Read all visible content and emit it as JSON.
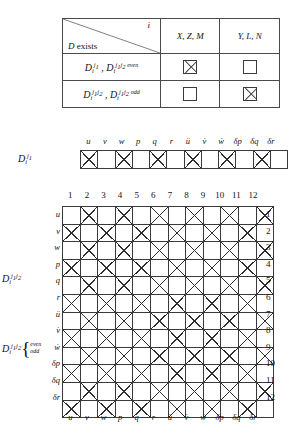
{
  "legend": {
    "corner": {
      "axis_col": "i",
      "axis_row_prefix": "D",
      "axis_row_text": " exists"
    },
    "col_headers": [
      "X, Z, M",
      "Y, L, N"
    ],
    "rows": [
      {
        "label_parts": [
          "D",
          "i",
          "j1",
          "D",
          "i",
          "j1 j2 even"
        ],
        "cells": [
          "x",
          "empty"
        ]
      },
      {
        "label_parts": [
          "D",
          "i",
          "j1 j2",
          "D",
          "i",
          "j1 j2 odd"
        ],
        "cells": [
          "empty",
          "x"
        ]
      }
    ],
    "row_label_display": [
      "Di^j1 , Di^j1j2 even",
      "Di^j1j2 , Di^j1j2 odd"
    ]
  },
  "strip": {
    "label": "Di^j1",
    "headers": [
      "u",
      "v",
      "w",
      "p",
      "q",
      "r",
      "ü",
      "v̇",
      "ẇ",
      "δp",
      "δq",
      "δr"
    ],
    "marks": [
      1,
      0,
      1,
      0,
      1,
      0,
      1,
      0,
      1,
      0,
      1,
      0
    ]
  },
  "main": {
    "col_numbers": [
      "1",
      "2",
      "3",
      "4",
      "5",
      "6",
      "7",
      "8",
      "9",
      "10",
      "11",
      "12"
    ],
    "row_numbers": [
      "1",
      "2",
      "3",
      "4",
      "5",
      "6",
      "7",
      "8",
      "9",
      "10",
      "11",
      "12"
    ],
    "row_headers": [
      "u",
      "v",
      "w",
      "p",
      "q",
      "r",
      "ü",
      "v̇",
      "ẇ",
      "δp",
      "δq",
      "δr"
    ],
    "bottom_headers": [
      "u",
      "v",
      "w",
      "p",
      "q",
      "r",
      "ü",
      "v̇",
      "ẇ",
      "δp",
      "δq",
      "δr"
    ],
    "side_label_top": "Di^j1j2",
    "side_label_bottom": "Di^j1j2",
    "brace_even": "even",
    "brace_odd": "odd",
    "matrix": [
      [
        0,
        1,
        0,
        1,
        0,
        1,
        0,
        1,
        0,
        1,
        0,
        1
      ],
      [
        1,
        0,
        1,
        0,
        1,
        0,
        1,
        0,
        1,
        0,
        1,
        0
      ],
      [
        0,
        1,
        0,
        1,
        0,
        1,
        0,
        1,
        0,
        1,
        0,
        1
      ],
      [
        1,
        0,
        1,
        0,
        1,
        0,
        1,
        0,
        1,
        0,
        1,
        0
      ],
      [
        0,
        1,
        0,
        1,
        0,
        1,
        0,
        1,
        0,
        1,
        0,
        1
      ],
      [
        1,
        0,
        1,
        0,
        1,
        0,
        1,
        0,
        1,
        0,
        1,
        0
      ],
      [
        0,
        1,
        0,
        1,
        0,
        1,
        0,
        1,
        0,
        1,
        0,
        1
      ],
      [
        1,
        0,
        1,
        0,
        1,
        0,
        1,
        0,
        1,
        0,
        1,
        0
      ],
      [
        0,
        1,
        0,
        1,
        0,
        1,
        0,
        1,
        0,
        1,
        0,
        1
      ],
      [
        1,
        0,
        1,
        0,
        1,
        0,
        1,
        0,
        1,
        0,
        1,
        0
      ],
      [
        0,
        1,
        0,
        1,
        0,
        1,
        0,
        1,
        0,
        1,
        0,
        1
      ],
      [
        1,
        0,
        1,
        0,
        1,
        0,
        1,
        0,
        1,
        0,
        1,
        0
      ]
    ]
  },
  "symbols": {
    "D": "D",
    "i_sub": "i",
    "j1": "j",
    "one": "1",
    "two": "2",
    "even": "even",
    "odd": "odd"
  },
  "colors": {
    "ink": "#2e2e2e",
    "rule": "#3a3a3a",
    "background": "#ffffff"
  }
}
